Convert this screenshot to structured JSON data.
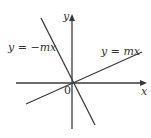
{
  "diagram": {
    "type": "coordinate-plane",
    "axes": {
      "x_label": "x",
      "y_label": "y",
      "origin_label": "0"
    },
    "lines": [
      {
        "id": "positive-slope",
        "label": "y = mx"
      },
      {
        "id": "negative-slope",
        "label": "y = −mx"
      }
    ],
    "colors": {
      "stroke": "#3a3a3a",
      "text": "#333333",
      "background": "#ffffff"
    }
  }
}
